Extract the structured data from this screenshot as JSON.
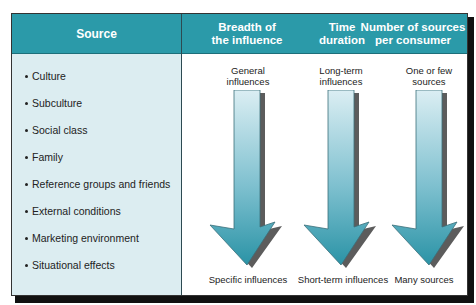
{
  "header": {
    "source": "Source",
    "columns": [
      {
        "title_line1": "Breadth of",
        "title_line2": "the influence"
      },
      {
        "title_line1": "Time",
        "title_line2": "duration"
      },
      {
        "title_line1": "Number of sources",
        "title_line2": "per consumer"
      }
    ]
  },
  "sources": [
    "Culture",
    "Subculture",
    "Social class",
    "Family",
    "Reference groups and friends",
    "External conditions",
    "Marketing environment",
    "Situational effects"
  ],
  "columns": [
    {
      "top_line1": "General",
      "top_line2": "influences",
      "bottom": "Specific influences"
    },
    {
      "top_line1": "Long-term",
      "top_line2": "influences",
      "bottom": "Short-term influences"
    },
    {
      "top_line1": "One or few",
      "top_line2": "sources",
      "bottom": "Many sources"
    }
  ],
  "colors": {
    "header": "#2b9aa9",
    "source_bg": "#dcedf1",
    "arrow_top": "#d8edf2",
    "arrow_bottom": "#2a93a6"
  }
}
